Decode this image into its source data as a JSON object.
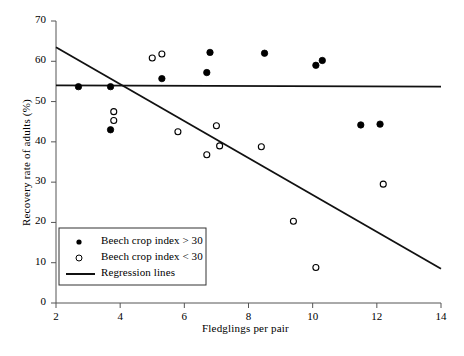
{
  "chart_data": {
    "type": "scatter",
    "title": "",
    "xlabel": "Fledglings per pair",
    "ylabel": "Recovery rate of adults (%)",
    "xlim": [
      2,
      14
    ],
    "ylim": [
      0,
      70
    ],
    "xticks": [
      2,
      4,
      6,
      8,
      10,
      12,
      14
    ],
    "yticks": [
      0,
      10,
      20,
      30,
      40,
      50,
      60,
      70
    ],
    "grid": false,
    "legend_position": "lower-left",
    "series": [
      {
        "name": "Beech crop index > 30",
        "marker": "filled-circle",
        "color": "#000000",
        "points": [
          {
            "x": 2.7,
            "y": 53.7
          },
          {
            "x": 3.7,
            "y": 43.0
          },
          {
            "x": 3.7,
            "y": 53.7
          },
          {
            "x": 5.3,
            "y": 55.7
          },
          {
            "x": 6.7,
            "y": 57.2
          },
          {
            "x": 6.8,
            "y": 62.2
          },
          {
            "x": 8.5,
            "y": 62.0
          },
          {
            "x": 10.1,
            "y": 59.0
          },
          {
            "x": 10.3,
            "y": 60.2
          },
          {
            "x": 11.5,
            "y": 44.2
          },
          {
            "x": 12.1,
            "y": 44.4
          }
        ]
      },
      {
        "name": "Beech crop index < 30",
        "marker": "open-circle",
        "color": "#000000",
        "points": [
          {
            "x": 3.8,
            "y": 47.5
          },
          {
            "x": 3.8,
            "y": 45.3
          },
          {
            "x": 5.0,
            "y": 60.8
          },
          {
            "x": 5.3,
            "y": 61.8
          },
          {
            "x": 5.8,
            "y": 42.5
          },
          {
            "x": 7.0,
            "y": 44.0
          },
          {
            "x": 7.1,
            "y": 39.0
          },
          {
            "x": 6.7,
            "y": 36.8
          },
          {
            "x": 8.4,
            "y": 38.8
          },
          {
            "x": 9.4,
            "y": 20.3
          },
          {
            "x": 10.1,
            "y": 8.8
          },
          {
            "x": 12.2,
            "y": 29.5
          }
        ]
      }
    ],
    "lines": [
      {
        "name": "Regression line (beech crop index > 30)",
        "x0": 2,
        "y0": 54.0,
        "x1": 14,
        "y1": 53.7
      },
      {
        "name": "Regression line (beech crop index < 30)",
        "x0": 2,
        "y0": 63.5,
        "x1": 14,
        "y1": 8.5
      }
    ],
    "legend": [
      {
        "marker": "filled-circle",
        "label": "Beech crop index > 30"
      },
      {
        "marker": "open-circle",
        "label": "Beech crop index < 30"
      },
      {
        "marker": "line",
        "label": "Regression lines"
      }
    ]
  },
  "caption": {
    "text": ""
  }
}
